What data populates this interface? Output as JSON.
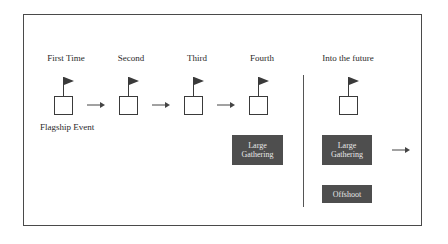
{
  "diagram": {
    "stages": [
      {
        "label": "First Time",
        "center_x": 66
      },
      {
        "label": "Second",
        "center_x": 131
      },
      {
        "label": "Third",
        "center_x": 197
      },
      {
        "label": "Fourth",
        "center_x": 262
      },
      {
        "label": "Into the future",
        "center_x": 348
      }
    ],
    "first_stage_caption": "Flagship Event",
    "boxes": {
      "large_gathering_fourth": {
        "line1": "Large",
        "line2": "Gathering"
      },
      "large_gathering_future": {
        "line1": "Large",
        "line2": "Gathering"
      },
      "offshoot": {
        "label": "Offshoot"
      }
    },
    "icons": {
      "flag": "flag-icon",
      "arrow": "arrow-right-icon"
    },
    "colors": {
      "frame": "#4a4a4a",
      "dark_box_fill": "#4e4e4e",
      "dark_box_text": "#e8e8e8",
      "flag_fill": "#3a3a3a",
      "line": "#555555"
    }
  }
}
